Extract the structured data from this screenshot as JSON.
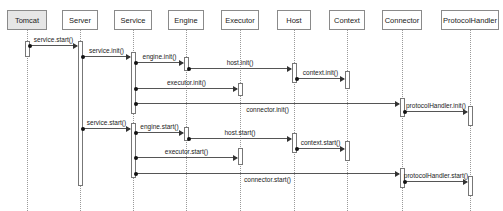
{
  "diagram": {
    "type": "sequence",
    "participants": [
      {
        "name": "Tomcat",
        "x": 27,
        "w": 40,
        "highlight": true
      },
      {
        "name": "Server",
        "x": 80,
        "w": 36
      },
      {
        "name": "Service",
        "x": 133,
        "w": 38
      },
      {
        "name": "Engine",
        "x": 186,
        "w": 36
      },
      {
        "name": "Executor",
        "x": 240,
        "w": 38
      },
      {
        "name": "Host",
        "x": 294,
        "w": 34
      },
      {
        "name": "Context",
        "x": 347,
        "w": 36
      },
      {
        "name": "Connector",
        "x": 402,
        "w": 40
      },
      {
        "name": "ProtocolHandler",
        "x": 470,
        "w": 58
      }
    ],
    "activations": [
      {
        "p": 0,
        "y1": 41,
        "y2": 57
      },
      {
        "p": 1,
        "y1": 41,
        "y2": 186
      },
      {
        "p": 2,
        "y1": 52,
        "y2": 114
      },
      {
        "p": 3,
        "y1": 57,
        "y2": 71
      },
      {
        "p": 5,
        "y1": 63,
        "y2": 83
      },
      {
        "p": 6,
        "y1": 71,
        "y2": 89
      },
      {
        "p": 4,
        "y1": 83,
        "y2": 96
      },
      {
        "p": 7,
        "y1": 98,
        "y2": 117
      },
      {
        "p": 8,
        "y1": 106,
        "y2": 126
      },
      {
        "p": 2,
        "y1": 123,
        "y2": 178
      },
      {
        "p": 3,
        "y1": 127,
        "y2": 141
      },
      {
        "p": 5,
        "y1": 133,
        "y2": 153
      },
      {
        "p": 6,
        "y1": 141,
        "y2": 161
      },
      {
        "p": 4,
        "y1": 148,
        "y2": 165
      },
      {
        "p": 7,
        "y1": 168,
        "y2": 188
      },
      {
        "p": 8,
        "y1": 176,
        "y2": 196
      }
    ],
    "messages": [
      {
        "label": "service.start()",
        "from": 0,
        "to": 1,
        "y": 45
      },
      {
        "label": "service.init()",
        "from": 1,
        "to": 2,
        "y": 56
      },
      {
        "label": "engine.init()",
        "from": 2,
        "to": 3,
        "y": 62
      },
      {
        "label": "host.init()",
        "from": 3,
        "to": 5,
        "y": 68
      },
      {
        "label": "context.init()",
        "from": 5,
        "to": 6,
        "y": 78
      },
      {
        "label": "executor.init()",
        "from": 2,
        "to": 4,
        "y": 88
      },
      {
        "label": "connector.init()",
        "from": 2,
        "to": 7,
        "y": 103,
        "label_below": true
      },
      {
        "label": "protocolHandler.init()",
        "from": 7,
        "to": 8,
        "y": 111
      },
      {
        "label": "service.start()",
        "from": 1,
        "to": 2,
        "y": 128
      },
      {
        "label": "engine.start()",
        "from": 2,
        "to": 3,
        "y": 132
      },
      {
        "label": "host.start()",
        "from": 3,
        "to": 5,
        "y": 138
      },
      {
        "label": "context.start()",
        "from": 5,
        "to": 6,
        "y": 148
      },
      {
        "label": "executor.start()",
        "from": 2,
        "to": 4,
        "y": 157
      },
      {
        "label": "connector.start()",
        "from": 2,
        "to": 7,
        "y": 173,
        "label_below": true
      },
      {
        "label": "protocolHandler.start()",
        "from": 7,
        "to": 8,
        "y": 181
      }
    ]
  }
}
